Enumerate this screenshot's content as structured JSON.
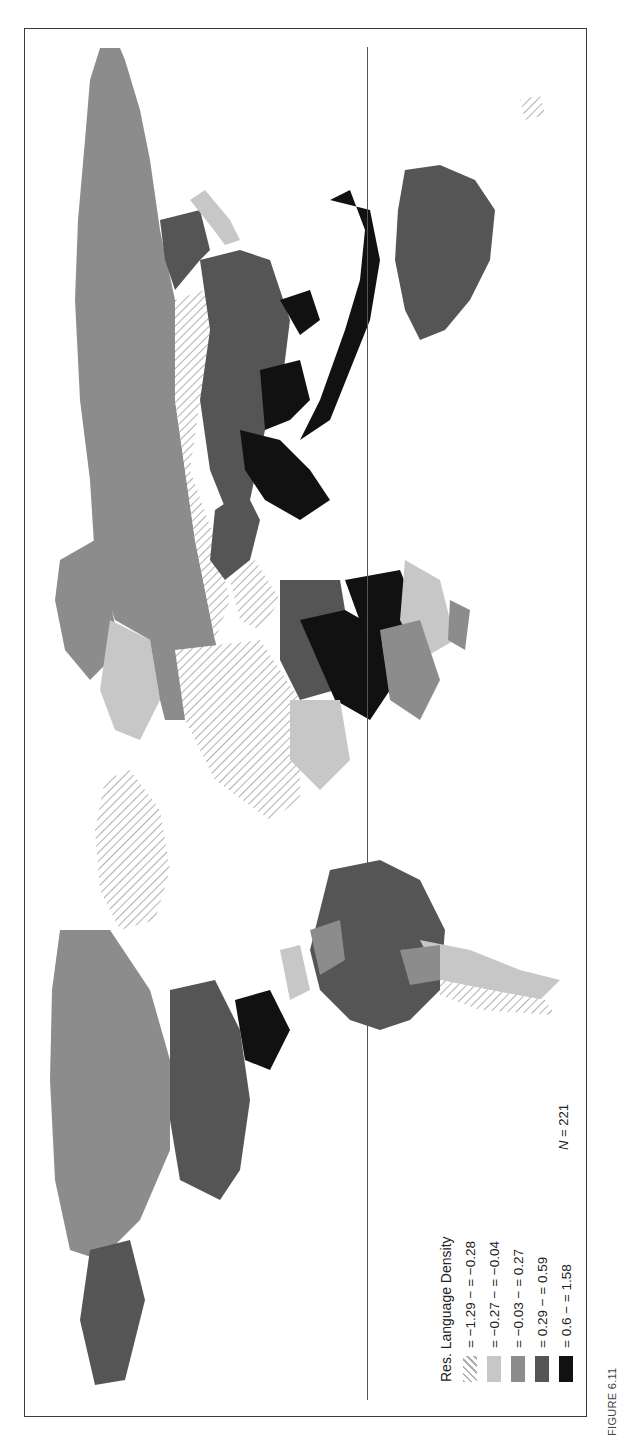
{
  "figure": {
    "caption": "FIGURE 6.11",
    "orientation": "rotated 90° counter-clockwise"
  },
  "map": {
    "type": "world choropleth",
    "reference_line": "equator",
    "colors": {
      "class_1": "#ffffff",
      "class_1_hatch": "#b5b5b5",
      "class_2": "#c7c7c7",
      "class_3": "#8c8c8c",
      "class_4": "#555555",
      "class_5": "#111111",
      "water": "#ffffff",
      "frame": "#3a3a3a"
    }
  },
  "legend": {
    "title": "Res. Language Density",
    "items": [
      {
        "label": "= −1.29 − = −0.28",
        "pattern": "hatched"
      },
      {
        "label": "= −0.27 − = −0.04",
        "color": "#c7c7c7"
      },
      {
        "label": "= −0.03 − = 0.27",
        "color": "#8c8c8c"
      },
      {
        "label": "= 0.29 − = 0.59",
        "color": "#555555"
      },
      {
        "label": "= 0.6 − = 1.58",
        "color": "#111111"
      }
    ],
    "n_label": "N",
    "n_value": "= 221"
  }
}
